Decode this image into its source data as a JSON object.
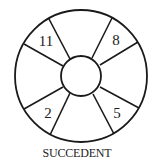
{
  "diagram": {
    "caption": "SUCCEDENT",
    "stroke_color": "#1a1a1a",
    "outer_circle": {
      "cx": 81,
      "cy": 76,
      "r": 66
    },
    "inner_circle": {
      "cx": 81,
      "cy": 76,
      "r": 20
    },
    "segments": [
      {
        "position": "top-left",
        "label": "11"
      },
      {
        "position": "top-right",
        "label": "8"
      },
      {
        "position": "bottom-left",
        "label": "2"
      },
      {
        "position": "bottom-right",
        "label": "5"
      }
    ]
  }
}
